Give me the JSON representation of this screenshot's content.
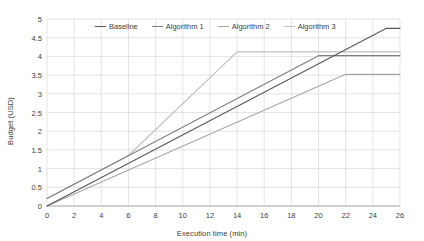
{
  "chart_data": {
    "type": "line",
    "title": "",
    "xlabel": "Execution time (min)",
    "ylabel": "Budget (USD)",
    "xlim": [
      0,
      26
    ],
    "ylim": [
      0,
      5
    ],
    "xticks": [
      0,
      2,
      4,
      6,
      8,
      10,
      12,
      14,
      16,
      18,
      20,
      22,
      24,
      26
    ],
    "xtick_labels": [
      "0",
      "2",
      "4",
      "6",
      "8",
      "10",
      "12",
      "14",
      "16",
      "18",
      "20",
      "22",
      "24",
      "26"
    ],
    "yticks": [
      0,
      0.5,
      1,
      1.5,
      2,
      2.5,
      3,
      3.5,
      4,
      4.5,
      5
    ],
    "ytick_labels": [
      "0",
      "0.5",
      "1",
      "1.5",
      "2",
      "2.5",
      "3",
      "3.5",
      "4",
      "4.5",
      "5"
    ],
    "grid": true,
    "grid_color": "#d9d9d9",
    "legend_position": "top-center",
    "series": [
      {
        "name": "Baseline",
        "color": "#595959",
        "x": [
          0,
          25,
          26
        ],
        "values": [
          0,
          4.75,
          4.75
        ]
      },
      {
        "name": "Algorithm 1",
        "color": "#7f7f7f",
        "x": [
          0,
          20,
          26
        ],
        "values": [
          0.2,
          4.02,
          4.02
        ]
      },
      {
        "name": "Algorithm 2",
        "color": "#a6a6a6",
        "x": [
          0,
          22,
          26
        ],
        "values": [
          0,
          3.52,
          3.52
        ]
      },
      {
        "name": "Algorithm 3",
        "color": "#bfbfbf",
        "x": [
          0,
          6,
          14,
          26
        ],
        "values": [
          0.2,
          1.35,
          4.12,
          4.12
        ]
      }
    ]
  },
  "legend": {
    "items": [
      {
        "label": "Baseline"
      },
      {
        "label": "Algorithm 1"
      },
      {
        "label": "Algorithm 2"
      },
      {
        "label": "Algorithm 3"
      }
    ]
  }
}
